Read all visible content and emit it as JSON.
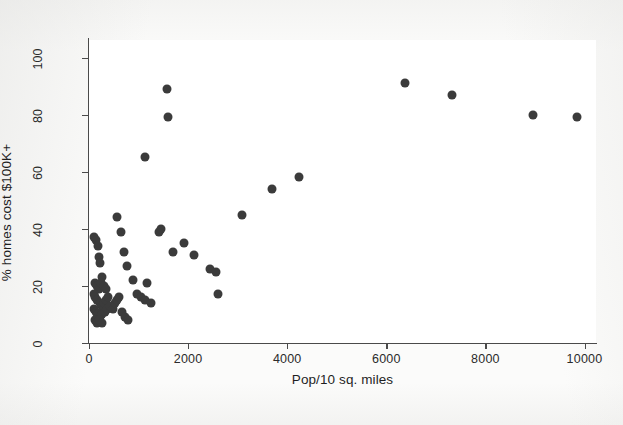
{
  "chart_data": {
    "type": "scatter",
    "title": "",
    "xlabel": "Pop/10 sq. miles",
    "ylabel": "% homes cost $100K+",
    "xlim": [
      0,
      10400
    ],
    "ylim": [
      0,
      103
    ],
    "xticks": [
      0,
      2000,
      4000,
      6000,
      8000,
      10000
    ],
    "xtick_labels": [
      "0",
      "2000",
      "4000",
      "6000",
      "8000",
      "10000"
    ],
    "yticks": [
      0,
      20,
      40,
      60,
      80,
      100
    ],
    "ytick_labels": [
      "0",
      "20",
      "40",
      "60",
      "80",
      "100"
    ],
    "grid": false,
    "legend": false,
    "marker": "filled-circle",
    "marker_color": "#3b3b3b",
    "marker_size_px": 9,
    "background_color": "#fbfbfa",
    "plot_background_color": "#ffffff",
    "axis_color": "#4a4a4a",
    "n_points": 62,
    "points": [
      [
        110,
        37
      ],
      [
        150,
        36
      ],
      [
        175,
        34
      ],
      [
        200,
        30
      ],
      [
        230,
        28
      ],
      [
        265,
        23
      ],
      [
        120,
        21
      ],
      [
        160,
        20
      ],
      [
        205,
        19
      ],
      [
        250,
        21
      ],
      [
        300,
        20
      ],
      [
        340,
        19
      ],
      [
        95,
        17
      ],
      [
        130,
        16
      ],
      [
        170,
        15
      ],
      [
        215,
        14
      ],
      [
        255,
        13
      ],
      [
        300,
        14
      ],
      [
        345,
        15
      ],
      [
        390,
        16
      ],
      [
        105,
        12
      ],
      [
        145,
        11
      ],
      [
        185,
        10
      ],
      [
        225,
        9
      ],
      [
        270,
        10
      ],
      [
        315,
        11
      ],
      [
        360,
        12
      ],
      [
        120,
        8
      ],
      [
        165,
        7
      ],
      [
        210,
        8
      ],
      [
        260,
        7
      ],
      [
        430,
        13
      ],
      [
        480,
        12
      ],
      [
        520,
        14
      ],
      [
        560,
        15
      ],
      [
        600,
        16
      ],
      [
        660,
        11
      ],
      [
        720,
        9
      ],
      [
        790,
        8
      ],
      [
        560,
        44
      ],
      [
        640,
        39
      ],
      [
        700,
        32
      ],
      [
        760,
        27
      ],
      [
        880,
        22
      ],
      [
        960,
        17
      ],
      [
        1040,
        16
      ],
      [
        1120,
        15
      ],
      [
        1180,
        21
      ],
      [
        1250,
        14
      ],
      [
        1120,
        65
      ],
      [
        1420,
        39
      ],
      [
        1460,
        40
      ],
      [
        1580,
        89
      ],
      [
        1600,
        79
      ],
      [
        1700,
        32
      ],
      [
        1920,
        35
      ],
      [
        2120,
        31
      ],
      [
        2450,
        26
      ],
      [
        2570,
        25
      ],
      [
        2610,
        17
      ],
      [
        3080,
        45
      ],
      [
        3700,
        54
      ],
      [
        4230,
        58
      ],
      [
        6380,
        91
      ],
      [
        7320,
        87
      ],
      [
        8960,
        80
      ],
      [
        9850,
        79
      ]
    ]
  }
}
